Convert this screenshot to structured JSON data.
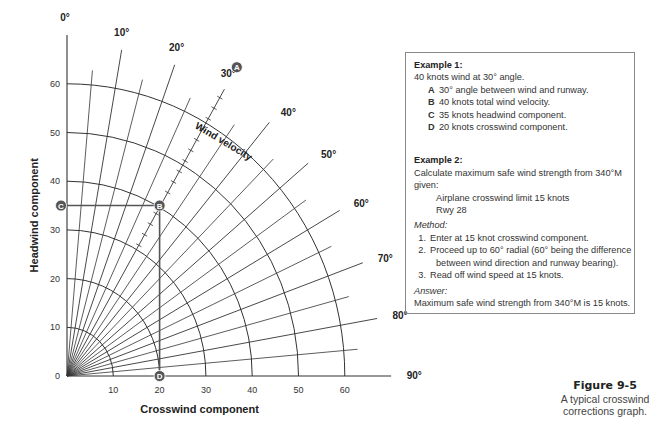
{
  "chart_data": {
    "type": "polar-component-grid",
    "title": "Figure 9-5",
    "caption": "A typical crosswind corrections graph.",
    "xlabel": "Crosswind component",
    "ylabel": "Headwind component",
    "x_ticks": [
      0,
      10,
      20,
      30,
      40,
      50,
      60
    ],
    "y_ticks": [
      0,
      10,
      20,
      30,
      40,
      50,
      60
    ],
    "xlim": [
      0,
      66
    ],
    "ylim": [
      0,
      66
    ],
    "arc_radii": [
      10,
      20,
      30,
      40,
      50,
      60
    ],
    "radial_labels": [
      "0°",
      "10°",
      "20°",
      "30°",
      "40°",
      "50°",
      "60°",
      "70°",
      "80°",
      "90°"
    ],
    "radial_angles_major": [
      0,
      10,
      20,
      30,
      40,
      50,
      60,
      70,
      80,
      90
    ],
    "radial_angles_minor": [
      5,
      15,
      25,
      35,
      45,
      55,
      65,
      75,
      85
    ],
    "curve_label": "Wind velocity",
    "example_points": [
      {
        "id": "A",
        "desc": "30° radial",
        "angle": 30
      },
      {
        "id": "B",
        "crosswind": 20,
        "headwind": 35,
        "wind_velocity": 40,
        "angle": 30
      },
      {
        "id": "C",
        "crosswind": 0,
        "headwind": 35
      },
      {
        "id": "D",
        "crosswind": 20,
        "headwind": 0
      }
    ],
    "grid": true
  },
  "geometry": {
    "origin_x": 67,
    "origin_y": 376,
    "scale_x": 4.63,
    "scale_y": 4.87,
    "major_len": 68,
    "minor_len": 63,
    "line_color": "#333333",
    "marker_color": "#555555"
  },
  "examples": {
    "ex1": {
      "heading": "Example 1:",
      "intro": "40 knots wind at 30° angle.",
      "items": [
        {
          "key": "A",
          "text": "30° angle between wind and runway."
        },
        {
          "key": "B",
          "text": "40 knots total wind velocity."
        },
        {
          "key": "C",
          "text": "35 knots headwind component."
        },
        {
          "key": "D",
          "text": "20 knots crosswind component."
        }
      ]
    },
    "ex2": {
      "heading": "Example 2:",
      "intro": "Calculate maximum safe wind strength from 340°M given:",
      "given": [
        "Airplane crosswind limit 15 knots",
        "Rwy 28"
      ],
      "method_label": "Method:",
      "steps": [
        {
          "n": "1.",
          "text": "Enter at 15 knot crosswind component."
        },
        {
          "n": "2.",
          "text": "Proceed up to 60° radial (60° being the difference",
          "cont": "between wind direction and runway bearing)."
        },
        {
          "n": "3.",
          "text": "Read off wind speed at 15 knots."
        }
      ],
      "answer_label": "Answer:",
      "answer": "Maximum safe wind strength from 340°M is 15 knots."
    }
  },
  "figure": {
    "number": "Figure 9-5",
    "caption_line1": "A typical crosswind",
    "caption_line2": "corrections graph."
  }
}
